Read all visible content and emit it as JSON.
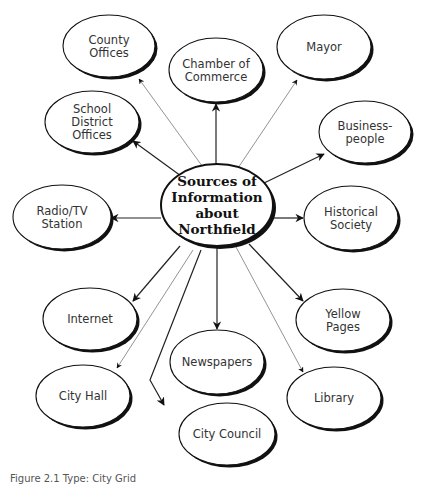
{
  "center": {
    "lines": [
      "Sources of",
      "Information",
      "about",
      "Northfield"
    ],
    "cx": 217,
    "cy": 205,
    "rx": 56,
    "ry": 41
  },
  "nodes": [
    {
      "id": "county-offices",
      "lines": [
        "County",
        "Offices"
      ],
      "cx": 109,
      "cy": 46,
      "rx": 46,
      "ry": 31,
      "edge": "thin",
      "path": [
        [
          205,
          170
        ],
        [
          139,
          79
        ]
      ]
    },
    {
      "id": "chamber-of-commerce",
      "lines": [
        "Chamber of",
        "Commerce"
      ],
      "cx": 216,
      "cy": 70,
      "rx": 47,
      "ry": 32,
      "edge": "bold",
      "path": [
        [
          216,
          164
        ],
        [
          216,
          104
        ]
      ]
    },
    {
      "id": "mayor",
      "lines": [
        "Mayor"
      ],
      "cx": 324,
      "cy": 47,
      "rx": 47,
      "ry": 32,
      "edge": "thin",
      "path": [
        [
          238,
          168
        ],
        [
          297,
          80
        ]
      ]
    },
    {
      "id": "business-people",
      "lines": [
        "Business-",
        "people"
      ],
      "cx": 365,
      "cy": 132,
      "rx": 46,
      "ry": 31,
      "edge": "bold",
      "path": [
        [
          262,
          184
        ],
        [
          324,
          154
        ]
      ]
    },
    {
      "id": "school-district-offices",
      "lines": [
        "School",
        "District",
        "Offices"
      ],
      "cx": 92,
      "cy": 122,
      "rx": 47,
      "ry": 31,
      "edge": "bold",
      "path": [
        [
          181,
          176
        ],
        [
          133,
          141
        ]
      ]
    },
    {
      "id": "radio-tv-station",
      "lines": [
        "Radio/TV",
        "Station"
      ],
      "cx": 62,
      "cy": 217,
      "rx": 49,
      "ry": 32,
      "edge": "bold",
      "path": [
        [
          161,
          218
        ],
        [
          111,
          218
        ]
      ]
    },
    {
      "id": "historical-society",
      "lines": [
        "Historical",
        "Society"
      ],
      "cx": 351,
      "cy": 218,
      "rx": 47,
      "ry": 32,
      "edge": "bold",
      "path": [
        [
          273,
          218
        ],
        [
          303,
          218
        ]
      ]
    },
    {
      "id": "internet",
      "lines": [
        "Internet"
      ],
      "cx": 90,
      "cy": 319,
      "rx": 47,
      "ry": 31,
      "edge": "bold",
      "path": [
        [
          180,
          246
        ],
        [
          133,
          301
        ]
      ]
    },
    {
      "id": "yellow-pages",
      "lines": [
        "Yellow",
        "Pages"
      ],
      "cx": 343,
      "cy": 320,
      "rx": 47,
      "ry": 31,
      "edge": "bold",
      "path": [
        [
          249,
          244
        ],
        [
          303,
          301
        ]
      ]
    },
    {
      "id": "newspapers",
      "lines": [
        "Newspapers"
      ],
      "cx": 217,
      "cy": 362,
      "rx": 47,
      "ry": 32,
      "edge": "bold",
      "path": [
        [
          217,
          247
        ],
        [
          217,
          329
        ]
      ]
    },
    {
      "id": "city-hall",
      "lines": [
        "City Hall"
      ],
      "cx": 83,
      "cy": 396,
      "rx": 47,
      "ry": 31,
      "edge": "thin",
      "path": [
        [
          193,
          250
        ],
        [
          117,
          368
        ]
      ]
    },
    {
      "id": "library",
      "lines": [
        "Library"
      ],
      "cx": 334,
      "cy": 398,
      "rx": 47,
      "ry": 31,
      "edge": "thin",
      "path": [
        [
          236,
          247
        ],
        [
          303,
          372
        ]
      ]
    },
    {
      "id": "city-council",
      "lines": [
        "City Council"
      ],
      "cx": 227,
      "cy": 434,
      "rx": 48,
      "ry": 31,
      "edge": "bold",
      "path": [
        [
          201,
          250
        ],
        [
          150,
          380
        ],
        [
          164,
          405
        ]
      ]
    }
  ],
  "caption": "Figure 2.1   Type: City Grid"
}
